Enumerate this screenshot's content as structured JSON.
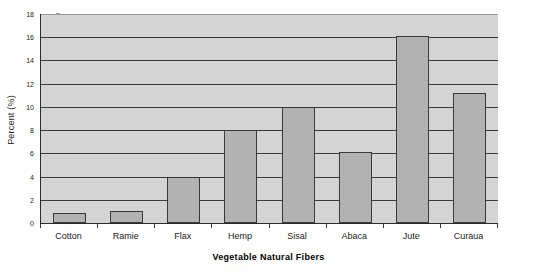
{
  "chart_data": {
    "type": "bar",
    "title": "",
    "xlabel": "Vegetable Natural Fibers",
    "ylabel": "Percent (%)",
    "categories": [
      "Cotton",
      "Ramie",
      "Flax",
      "Hemp",
      "Sisal",
      "Abaca",
      "Jute",
      "Curaua"
    ],
    "values": [
      0.9,
      1.0,
      4.0,
      8.0,
      10.0,
      6.1,
      16.1,
      11.2
    ],
    "ylim": [
      0,
      18
    ],
    "ytick_step": 2,
    "yticks": [
      0,
      2,
      4,
      6,
      8,
      10,
      12,
      14,
      16,
      18
    ],
    "ytick_labels": [
      "0",
      "2",
      "4",
      "6",
      "8",
      "10",
      "12",
      "14",
      "16",
      "18"
    ],
    "grid": true,
    "grid_axis": "y",
    "legend": false,
    "legend_position": "none",
    "series": [
      {
        "name": "Percent",
        "values": [
          0.9,
          1.0,
          4.0,
          8.0,
          10.0,
          6.1,
          16.1,
          11.2
        ]
      }
    ]
  },
  "style": {
    "plot_background": "#d4d4d4",
    "figure_background": "#ffffff",
    "bar_fill": "#b2b2b2",
    "bar_border": "#3a3a3a",
    "gridline_color": "#3c3c3c",
    "axis_color": "#2b2b2b",
    "text_color": "#1a1a1a"
  }
}
